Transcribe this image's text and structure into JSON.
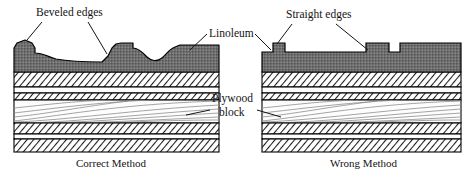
{
  "figure": {
    "type": "cross-section-diagram",
    "title_present": false,
    "panels": [
      {
        "id": "correct",
        "caption": "Correct Method",
        "edge_style": "beveled",
        "x_range": [
          14,
          219
        ]
      },
      {
        "id": "wrong",
        "caption": "Wrong Method",
        "edge_style": "straight",
        "x_range": [
          262,
          461
        ]
      }
    ]
  },
  "labels": {
    "beveled_edges": "Beveled edges",
    "straight_edges": "Straight edges",
    "linoleum": "Linoleum",
    "plywood_line1": "Plywood",
    "plywood_line2": "block",
    "caption_correct": "Correct Method",
    "caption_wrong": "Wrong Method"
  },
  "colors": {
    "linoleum_fill": "#6e6e6e",
    "hatch_stroke": "#1a1a1a",
    "outline": "#000000",
    "grain_stroke": "#8d8d8d",
    "paper": "#ffffff",
    "text": "#141414"
  },
  "layers": [
    {
      "name": "linoleum",
      "fill": "dark-stipple",
      "top": 45,
      "bottom": 72
    },
    {
      "name": "adhesive-veneer",
      "fill": "hatch-right",
      "top": 72,
      "bottom": 87
    },
    {
      "name": "thin-white-ply",
      "fill": "plain",
      "top": 87,
      "bottom": 93
    },
    {
      "name": "cross-band",
      "fill": "hatch-right",
      "top": 93,
      "bottom": 100
    },
    {
      "name": "plywood-core",
      "fill": "wood-grain",
      "top": 100,
      "bottom": 123
    },
    {
      "name": "cross-band-2",
      "fill": "hatch-right",
      "top": 123,
      "bottom": 134
    },
    {
      "name": "thin-white-ply-2",
      "fill": "plain",
      "top": 134,
      "bottom": 139
    },
    {
      "name": "backing-veneer",
      "fill": "hatch-right",
      "top": 139,
      "bottom": 152
    }
  ],
  "icons": {
    "leader_line": "leader-line"
  }
}
